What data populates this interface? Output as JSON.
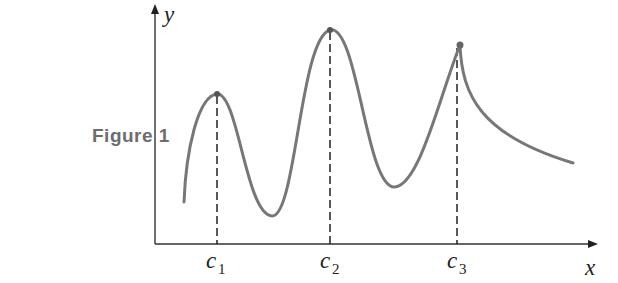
{
  "figure": {
    "label": "Figure 1"
  },
  "axes": {
    "x_label": "x",
    "y_label": "y"
  },
  "critical_points": [
    {
      "name": "c",
      "sub": "1",
      "type": "local maximum (smooth)"
    },
    {
      "name": "c",
      "sub": "2",
      "type": "absolute maximum (smooth)"
    },
    {
      "name": "c",
      "sub": "3",
      "type": "local maximum (cusp)"
    }
  ],
  "colors": {
    "curve": "#777777",
    "axis": "#333333",
    "dashed": "#222222",
    "label": "#6d6d6d"
  }
}
